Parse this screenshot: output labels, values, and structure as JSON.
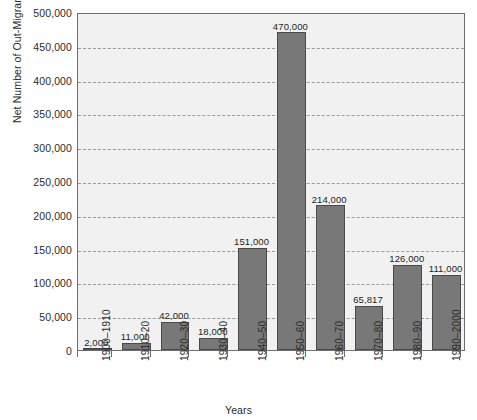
{
  "chart_data": {
    "type": "bar",
    "title": "",
    "xlabel": "Years",
    "ylabel": "Net Number of Out-Migrants",
    "ylim": [
      0,
      500000
    ],
    "ytick_step": 50000,
    "grid": true,
    "legend": null,
    "categories": [
      "1900–1910",
      "1910–20",
      "1920–30",
      "1930–40",
      "1940–50",
      "1950–60",
      "1960–70",
      "1970–80",
      "1980–90",
      "1990–2000"
    ],
    "values": [
      2000,
      11000,
      42000,
      18000,
      151000,
      470000,
      214000,
      65817,
      126000,
      111000
    ],
    "data_labels": [
      "2,000",
      "11,000",
      "42,000",
      "18,000",
      "151,000",
      "470,000",
      "214,000",
      "65,817",
      "126,000",
      "111,000"
    ],
    "ytick_labels": [
      "0",
      "50,000",
      "100,000",
      "150,000",
      "200,000",
      "250,000",
      "300,000",
      "350,000",
      "400,000",
      "450,000",
      "500,000"
    ],
    "colors": {
      "bar_fill": "#787878",
      "bar_stroke": "#4a4a4a",
      "plot_background": "#f1f1f1",
      "plot_border": "#6f6f6f",
      "gridline": "#9a9a9a",
      "text": "#231f20"
    }
  },
  "annotations": {
    "clipped_title": " "
  }
}
